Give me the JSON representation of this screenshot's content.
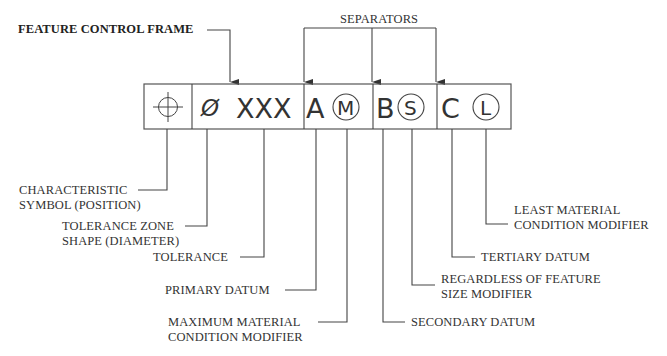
{
  "title": "FEATURE CONTROL FRAME",
  "separators_label": "SEPARATORS",
  "frame": {
    "characteristic_symbol": "position-icon",
    "diameter_symbol": "Ø",
    "tolerance": "XXX",
    "primary_datum": "A",
    "primary_modifier": "M",
    "secondary_datum": "B",
    "secondary_modifier": "S",
    "tertiary_datum": "C",
    "tertiary_modifier": "L"
  },
  "callouts": {
    "characteristic": [
      "CHARACTERISTIC",
      "SYMBOL (POSITION)"
    ],
    "tolerance_zone": [
      "TOLERANCE ZONE",
      "SHAPE (DIAMETER)"
    ],
    "tolerance": "TOLERANCE",
    "primary_datum": "PRIMARY DATUM",
    "mmc": [
      "MAXIMUM MATERIAL",
      "CONDITION MODIFIER"
    ],
    "secondary_datum": "SECONDARY DATUM",
    "rfs": [
      "REGARDLESS OF FEATURE",
      "SIZE MODIFIER"
    ],
    "tertiary_datum": "TERTIARY DATUM",
    "lmc": [
      "LEAST MATERIAL",
      "CONDITION MODIFIER"
    ]
  },
  "colors": {
    "line": "#444444",
    "background": "#ffffff"
  }
}
